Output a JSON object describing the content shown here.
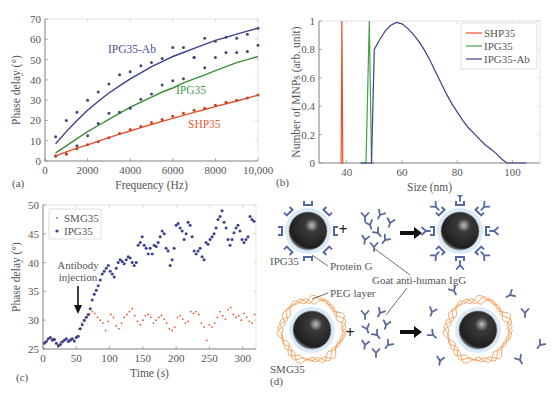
{
  "figure": {
    "panels": [
      "(a)",
      "(b)",
      "(c)",
      "(d)"
    ]
  },
  "chart_data": [
    {
      "panel": "(a)",
      "type": "scatter",
      "title": "",
      "xlabel": "Frequency (Hz)",
      "ylabel": "Phase delay (°)",
      "xlim": [
        0,
        10000
      ],
      "ylim": [
        0,
        70
      ],
      "xticks": [
        "0",
        "2000",
        "4000",
        "6000",
        "8000",
        "10,000"
      ],
      "yticks": [
        "0",
        "10",
        "20",
        "30",
        "40",
        "50",
        "60",
        "70"
      ],
      "grid": false,
      "annotations": [
        "IPG35-Ab",
        "IPG35",
        "SHP35"
      ],
      "series": [
        {
          "name": "IPG35-Ab",
          "color": "#3b3f8f",
          "x": [
            500,
            1000,
            1500,
            2000,
            2500,
            3000,
            3500,
            4000,
            4500,
            5000,
            5500,
            6000,
            6500,
            7000,
            7500,
            8000,
            8500,
            9000,
            9500,
            10000
          ],
          "points": [
            12,
            20,
            24,
            30,
            34,
            38,
            42.5,
            44,
            47,
            48.5,
            50.5,
            56,
            56,
            51,
            60.5,
            59,
            61,
            60.5,
            62.5,
            65.5
          ],
          "fit": [
            8.5,
            14.5,
            20,
            25,
            29.5,
            33.5,
            37,
            40.5,
            43.5,
            46.5,
            49,
            51.5,
            53.5,
            55.5,
            57.5,
            59.5,
            61,
            62.5,
            64,
            65.5
          ]
        },
        {
          "name": "IPG35",
          "color": "#3a8f3a",
          "x": [
            500,
            1000,
            1500,
            2000,
            2500,
            3000,
            3500,
            4000,
            4500,
            5000,
            5500,
            6000,
            6500,
            7000,
            7500,
            8000,
            8500,
            9000,
            9500,
            10000
          ],
          "points": [
            2.5,
            3.5,
            7.5,
            12.5,
            18.5,
            23.5,
            24,
            26,
            30.5,
            33,
            37.5,
            39.5,
            40.5,
            51,
            46,
            51,
            53.5,
            53.5,
            54,
            57
          ],
          "fit": [
            4,
            7.5,
            11,
            14.5,
            17.5,
            20.5,
            23.5,
            26.5,
            29,
            31.5,
            34,
            36,
            38.5,
            40.5,
            42.5,
            44.5,
            46.5,
            48.5,
            50,
            51.5
          ]
        },
        {
          "name": "SHP35",
          "color": "#e8502a",
          "x": [
            500,
            1000,
            1500,
            2000,
            2500,
            3000,
            3500,
            4000,
            4500,
            5000,
            5500,
            6000,
            6500,
            7000,
            7500,
            8000,
            8500,
            9000,
            9500,
            10000
          ],
          "points": [
            2.5,
            3.5,
            6,
            8,
            9.5,
            11.5,
            13.5,
            15.5,
            17,
            19,
            20.5,
            22,
            23.5,
            25,
            26,
            27.5,
            29,
            30,
            31,
            32.5
          ],
          "fit": [
            2.5,
            4.5,
            6.3,
            8,
            9.8,
            11.5,
            13.2,
            14.8,
            16.4,
            18,
            19.5,
            21,
            22.5,
            24,
            25.4,
            26.8,
            28.2,
            29.6,
            31,
            32.5
          ]
        }
      ]
    },
    {
      "panel": "(b)",
      "type": "line",
      "title": "",
      "xlabel": "Size (nm)",
      "ylabel": "Number of MNPs (arb. unit)",
      "xlim": [
        30,
        110
      ],
      "ylim": [
        0,
        1
      ],
      "xticks": [
        "40",
        "60",
        "80",
        "100"
      ],
      "yticks": [
        "0",
        "0.2",
        "0.4",
        "0.6",
        "0.8",
        "1"
      ],
      "legend": [
        "SHP35",
        "IPG35",
        "IPG35-Ab"
      ],
      "legend_position": "upper right",
      "grid": false,
      "series": [
        {
          "name": "SHP35",
          "color": "#e8502a",
          "x": [
            37.5,
            38.0,
            38.3,
            38.6,
            39.0
          ],
          "y": [
            0,
            0,
            1,
            0,
            0
          ]
        },
        {
          "name": "IPG35",
          "color": "#46a046",
          "x": [
            45.5,
            47.0,
            48.2,
            49.0,
            50.0
          ],
          "y": [
            0,
            0,
            1,
            0,
            0
          ]
        },
        {
          "name": "IPG35-Ab",
          "color": "#3b3f8f",
          "x": [
            45,
            49,
            50,
            52,
            54,
            56,
            58,
            60,
            62,
            64,
            66,
            68,
            70,
            72,
            74,
            76,
            78,
            80,
            82,
            84,
            86,
            88,
            90,
            92,
            94,
            96,
            98,
            100,
            105
          ],
          "y": [
            0,
            0,
            0.8,
            0.87,
            0.93,
            0.97,
            0.99,
            0.98,
            0.95,
            0.91,
            0.86,
            0.8,
            0.73,
            0.65,
            0.57,
            0.49,
            0.42,
            0.36,
            0.3,
            0.25,
            0.21,
            0.17,
            0.13,
            0.1,
            0.07,
            0.03,
            0,
            0,
            0
          ]
        }
      ]
    },
    {
      "panel": "(c)",
      "type": "scatter",
      "title": "",
      "xlabel": "Time (s)",
      "ylabel": "Phase delay (°)",
      "xlim": [
        0,
        320
      ],
      "ylim": [
        25,
        50
      ],
      "xticks": [
        "0",
        "50",
        "100",
        "150",
        "200",
        "250",
        "300"
      ],
      "yticks": [
        "25",
        "30",
        "35",
        "40",
        "45",
        "50"
      ],
      "legend": [
        "SMG35",
        "IPG35"
      ],
      "legend_position": "upper left",
      "annotation": {
        "text_line1": "Antibody",
        "text_line2": "injection",
        "arrow_x": 52,
        "arrow_y": 30.5
      },
      "series": [
        {
          "name": "SMG35",
          "color": "#e8502a",
          "marker": "small-dot",
          "x": [
            2,
            6,
            10,
            14,
            18,
            22,
            26,
            30,
            34,
            38,
            42,
            46,
            50,
            54,
            58,
            62,
            66,
            70,
            74,
            78,
            82,
            86,
            90,
            94,
            98,
            102,
            106,
            110,
            114,
            118,
            122,
            126,
            130,
            134,
            138,
            142,
            146,
            150,
            154,
            158,
            162,
            166,
            170,
            174,
            178,
            182,
            186,
            190,
            194,
            198,
            202,
            206,
            210,
            214,
            218,
            222,
            226,
            230,
            234,
            238,
            242,
            246,
            250,
            254,
            258,
            262,
            266,
            270,
            274,
            278,
            282,
            286,
            290,
            294,
            298,
            302,
            306,
            310,
            314,
            318
          ],
          "y": [
            26.2,
            26.5,
            27,
            26.8,
            26.5,
            25.8,
            26.2,
            26.4,
            26.8,
            26.5,
            26.8,
            26.5,
            27.2,
            28.5,
            29.5,
            29.8,
            30.5,
            31,
            31.5,
            31.2,
            30.5,
            30,
            29.5,
            28.2,
            29.8,
            31,
            30.5,
            29,
            28.5,
            29.5,
            30.5,
            31,
            31.5,
            32,
            30.8,
            29.8,
            29.2,
            30,
            30.8,
            31,
            30.5,
            29.5,
            30,
            30.5,
            30.8,
            30.2,
            29.5,
            28.5,
            28.2,
            28.8,
            30.5,
            30.8,
            30.2,
            29.5,
            29.8,
            31.5,
            31.2,
            31.5,
            31,
            29.5,
            28.8,
            26.5,
            29.2,
            28.8,
            29.5,
            30.5,
            31.5,
            30.8,
            30.2,
            31.8,
            32.2,
            31,
            30.5,
            30.8,
            30,
            31.2,
            30.5,
            29.8,
            29.5,
            31
          ]
        },
        {
          "name": "IPG35",
          "color": "#3b3f8f",
          "marker": "dot",
          "x": [
            2,
            5,
            8,
            11,
            14,
            17,
            20,
            23,
            26,
            29,
            32,
            35,
            38,
            41,
            44,
            47,
            50,
            53,
            56,
            59,
            62,
            65,
            68,
            71,
            74,
            77,
            80,
            83,
            86,
            89,
            92,
            95,
            98,
            101,
            104,
            107,
            110,
            113,
            116,
            119,
            122,
            125,
            128,
            131,
            134,
            137,
            140,
            143,
            146,
            149,
            152,
            155,
            158,
            161,
            164,
            167,
            170,
            173,
            176,
            179,
            182,
            185,
            188,
            191,
            194,
            197,
            200,
            203,
            206,
            209,
            212,
            215,
            218,
            221,
            224,
            227,
            230,
            233,
            236,
            239,
            242,
            245,
            248,
            251,
            254,
            257,
            260,
            263,
            266,
            269,
            272,
            275,
            278,
            281,
            284,
            287,
            290,
            293,
            296,
            299,
            302,
            305,
            308,
            311,
            314,
            317
          ],
          "y": [
            26,
            26.3,
            26.8,
            27,
            26.5,
            26.7,
            26,
            25.5,
            25.8,
            26.2,
            26.5,
            26.8,
            26.3,
            26.5,
            26.8,
            26.4,
            27,
            27.2,
            28.5,
            29.2,
            30,
            30.5,
            31,
            32,
            33.5,
            34.5,
            35.2,
            36,
            37,
            38,
            38.5,
            39,
            39.5,
            38.5,
            38,
            37.5,
            39,
            40,
            40.5,
            40.2,
            39.8,
            40.5,
            41,
            40.8,
            40,
            39.5,
            40,
            43,
            43.5,
            44.5,
            43,
            42.5,
            41.5,
            42.5,
            41.5,
            43,
            42.8,
            43.5,
            44.5,
            45.5,
            45,
            42.5,
            42,
            39.5,
            40.5,
            42.5,
            46.5,
            46.8,
            46,
            45.5,
            44,
            45,
            47,
            46.5,
            44.5,
            42,
            41.5,
            42,
            42.5,
            41,
            40.5,
            43.5,
            43.2,
            44,
            44.5,
            45,
            46,
            47.5,
            48,
            49,
            47,
            46,
            44,
            43,
            44,
            45.2,
            46,
            46.5,
            45.5,
            44,
            43.5,
            44,
            44.5,
            48,
            47.5,
            47.2
          ]
        }
      ]
    }
  ],
  "diagram_d": {
    "labels": {
      "top_particle": "IPG35",
      "protein": "Protein G",
      "antibody": "Goat anti-human IgG",
      "peg": "PEG layer",
      "bottom_particle": "SMG35"
    },
    "plus": "+",
    "colors": {
      "protein_g": "#5468a8",
      "antibody": "#5a6a9a",
      "peg": "#f09040",
      "halo": "#cfe4f2",
      "core": "#2a2a2a"
    }
  }
}
